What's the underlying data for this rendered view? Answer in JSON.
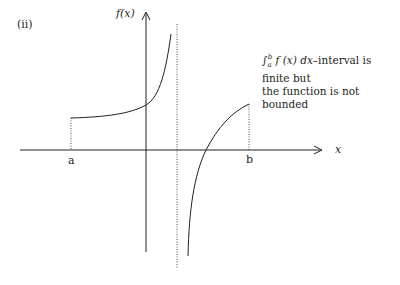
{
  "figure": {
    "panel_label": "(ii)",
    "y_axis_label": "f(x)",
    "x_axis_label": "x",
    "point_a_label": "a",
    "point_b_label": "b",
    "annotation": {
      "integral": "∫",
      "lower_limit": "a",
      "upper_limit": "b",
      "integrand": "f (x) dx",
      "line1_rest": "–interval is finite but",
      "line2": "the function is not bounded"
    },
    "colors": {
      "stroke": "#231f20",
      "background": "#ffffff"
    }
  }
}
